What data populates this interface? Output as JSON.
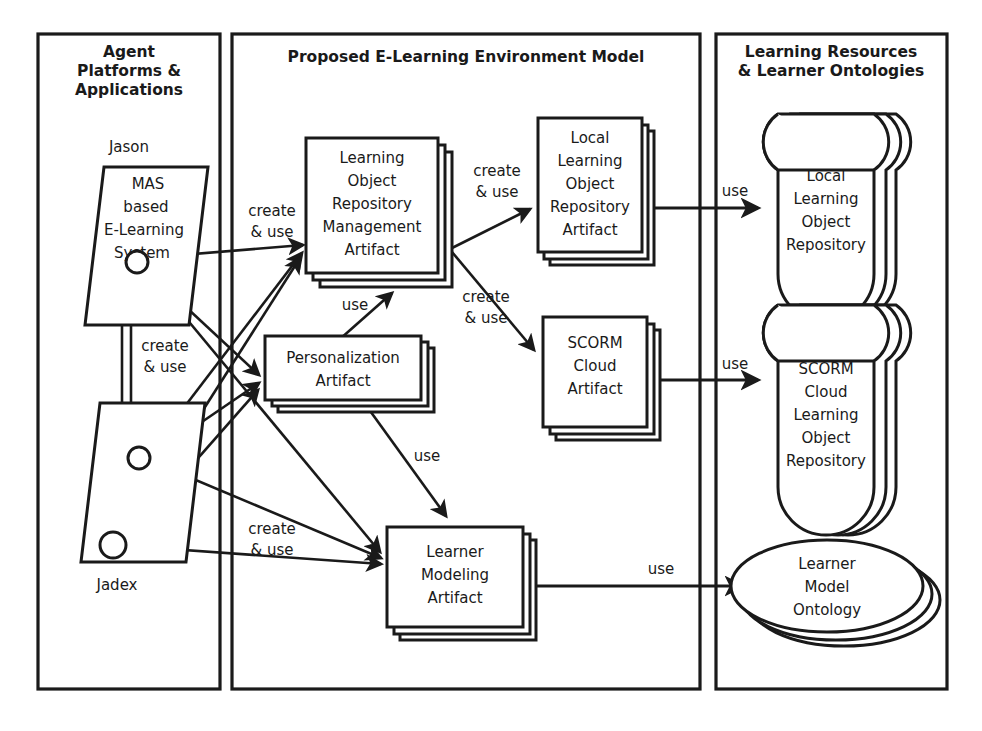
{
  "diagram": {
    "title": "Proposed E-Learning Environment Model",
    "colors": {
      "ink": "#1a1a1a",
      "paper": "#ffffff"
    },
    "panels": [
      {
        "id": "agent-platforms",
        "title_lines": [
          "Agent",
          "Platforms &",
          "Applications"
        ]
      },
      {
        "id": "environment-model",
        "title_lines": [
          "Proposed E-Learning Environment Model"
        ]
      },
      {
        "id": "resources-ontologies",
        "title_lines": [
          "Learning Resources",
          "& Learner Ontologies"
        ]
      }
    ],
    "agents": [
      {
        "id": "jason",
        "platform_label": "Jason",
        "body_lines": [
          "MAS",
          "based",
          "E-Learning",
          "System"
        ]
      },
      {
        "id": "jadex",
        "platform_label": "Jadex",
        "body_lines": []
      }
    ],
    "artifacts": [
      {
        "id": "lor-management-artifact",
        "lines": [
          "Learning",
          "Object",
          "Repository",
          "Management",
          "Artifact"
        ]
      },
      {
        "id": "local-lor-artifact",
        "lines": [
          "Local",
          "Learning",
          "Object",
          "Repository",
          "Artifact"
        ]
      },
      {
        "id": "personalization-artifact",
        "lines": [
          "Personalization",
          "Artifact"
        ]
      },
      {
        "id": "scorm-cloud-artifact",
        "lines": [
          "SCORM",
          "Cloud",
          "Artifact"
        ]
      },
      {
        "id": "learner-modeling-artifact",
        "lines": [
          "Learner",
          "Modeling",
          "Artifact"
        ]
      }
    ],
    "repositories": [
      {
        "id": "local-lor",
        "shape": "cylinder-stack",
        "lines": [
          "Local",
          "Learning",
          "Object",
          "Repository"
        ]
      },
      {
        "id": "scorm-cloud-lor",
        "shape": "cylinder-stack",
        "lines": [
          "SCORM",
          "Cloud",
          "Learning",
          "Object",
          "Repository"
        ]
      },
      {
        "id": "learner-model-ontology",
        "shape": "ellipse-stack",
        "lines": [
          "Learner",
          "Model",
          "Ontology"
        ]
      }
    ],
    "edge_labels": [
      {
        "id": "agents-to-lorm",
        "lines": [
          "create",
          "& use"
        ]
      },
      {
        "id": "lorm-to-local-artifact",
        "lines": [
          "create",
          "& use"
        ]
      },
      {
        "id": "agents-to-personalization",
        "lines": [
          "create",
          "& use"
        ]
      },
      {
        "id": "lorm-to-scorm-artifact",
        "lines": [
          "create",
          "& use"
        ]
      },
      {
        "id": "personalization-to-lorm",
        "lines": [
          "use"
        ]
      },
      {
        "id": "personalization-to-learner-modeling",
        "lines": [
          "use"
        ]
      },
      {
        "id": "agents-to-learner-modeling",
        "lines": [
          "create",
          "& use"
        ]
      },
      {
        "id": "local-artifact-to-local-repo",
        "lines": [
          "use"
        ]
      },
      {
        "id": "scorm-artifact-to-scorm-repo",
        "lines": [
          "use"
        ]
      },
      {
        "id": "learner-modeling-to-ontology",
        "lines": [
          "use"
        ]
      }
    ]
  }
}
